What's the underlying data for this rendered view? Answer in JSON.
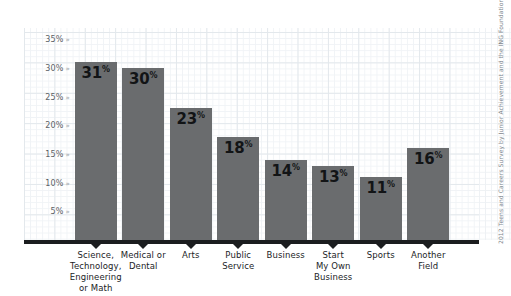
{
  "chart_data": {
    "type": "bar",
    "title": "",
    "xlabel": "",
    "ylabel": "",
    "ylim": [
      0,
      37
    ],
    "grid": true,
    "legend": "none",
    "categories": [
      "Science, Technology, Engineering or Math",
      "Medical or Dental",
      "Arts",
      "Public Service",
      "Business",
      "Start My Own Business",
      "Sports",
      "Another Field"
    ],
    "values": [
      31,
      30,
      23,
      18,
      14,
      13,
      11,
      16
    ],
    "value_labels": [
      "31",
      "30",
      "23",
      "18",
      "14",
      "13",
      "11",
      "16"
    ],
    "value_suffix": "%",
    "ytick_labels": [
      "35%",
      "30%",
      "25%",
      "20%",
      "15%",
      "10%",
      "5%"
    ],
    "ytick_values": [
      35,
      30,
      25,
      20,
      15,
      10,
      5
    ],
    "ytick_marker": "»"
  },
  "categories_display": [
    "Science,\nTechnology,\nEngineering\nor Math",
    "Medical or\nDental",
    "Arts",
    "Public\nService",
    "Business",
    "Start\nMy Own\nBusiness",
    "Sports",
    "Another\nField"
  ],
  "source_credit": "2012 Teens and Careers Survey by Junior Achievement and the ING Foundation",
  "colors": {
    "bar_fill": "#6a6c6e",
    "axis": "#1b1d1f",
    "grid_minor": "#f0f3f6",
    "grid_major": "#e3e8ec",
    "tick_text": "#5c6166",
    "label_text": "#1b1d1f",
    "credit_text": "#7d848a",
    "background": "#ffffff"
  }
}
